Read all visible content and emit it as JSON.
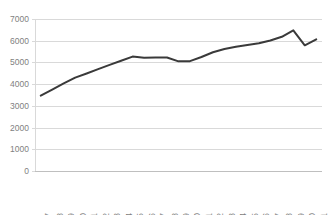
{
  "chart_data": {
    "type": "line",
    "title": "",
    "subtitle": "",
    "xlabel": "",
    "ylabel": "",
    "categories": [
      "1997",
      "1998",
      "1999",
      "2000",
      "2001",
      "2002",
      "2003",
      "2004",
      "2005",
      "2006",
      "2007",
      "2008",
      "2009",
      "2010",
      "2011",
      "2012",
      "2013",
      "2014",
      "2015",
      "2016",
      "2017",
      "2018",
      "2019",
      "2020",
      "2021"
    ],
    "values": [
      3470,
      3750,
      4030,
      4300,
      4490,
      4690,
      4890,
      5080,
      5270,
      5220,
      5230,
      5230,
      5050,
      5060,
      5250,
      5470,
      5620,
      5720,
      5800,
      5880,
      6010,
      6180,
      6480,
      5790,
      6060
    ],
    "series": [
      {
        "name": "Series 1",
        "values": [
          3470,
          3750,
          4030,
          4300,
          4490,
          4690,
          4890,
          5080,
          5270,
          5220,
          5230,
          5230,
          5050,
          5060,
          5250,
          5470,
          5620,
          5720,
          5800,
          5880,
          6010,
          6180,
          6480,
          5790,
          6060
        ]
      }
    ],
    "ylim": [
      0,
      7000
    ],
    "ytick_values": [
      0,
      1000,
      2000,
      3000,
      4000,
      5000,
      6000,
      7000
    ],
    "ytick_labels": [
      "0",
      "1000",
      "2000",
      "3000",
      "4000",
      "5000",
      "6000",
      "7000"
    ],
    "xtick_labels": [
      "1997",
      "1998",
      "1999",
      "2000",
      "2001",
      "2002",
      "2003",
      "2004",
      "2005",
      "2006",
      "2007",
      "2008",
      "2009",
      "2010",
      "2011",
      "2012",
      "2013",
      "2014",
      "2015",
      "2016",
      "2017",
      "2018",
      "2019",
      "2020",
      "2021"
    ],
    "xtick_rotation": 90,
    "grid": true,
    "grid_axis": "y",
    "legend": false,
    "legend_position": "none",
    "annotations": [],
    "colors": {
      "line": "#3a3a3a",
      "grid": "#d9d9d9",
      "tick_text": "#7f7f7f",
      "background": "#ffffff"
    }
  }
}
